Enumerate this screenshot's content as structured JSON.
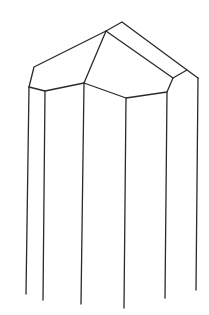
{
  "figure": {
    "line_color": "#2a2a2a",
    "background_color": "#ffffff"
  }
}
